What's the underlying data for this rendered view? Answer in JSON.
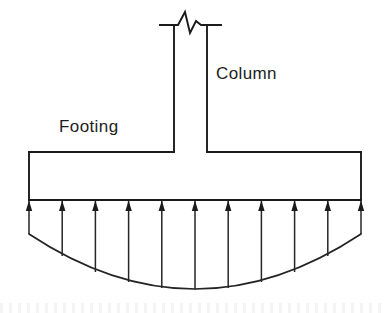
{
  "figure": {
    "type": "engineering-diagram",
    "background_color": "#ffffff",
    "line_color": "#1b1b1b",
    "labels": {
      "column": "Column",
      "footing": "Footing"
    },
    "label_positions": {
      "column": {
        "x": 216,
        "y": 79
      },
      "footing": {
        "x": 59,
        "y": 132
      }
    },
    "column": {
      "left_x": 174,
      "right_x": 207,
      "top_y": 25,
      "bottom_y": 152,
      "break_symbol": "zigzag-break",
      "break_left_tick_x": 160,
      "break_right_tick_x": 221,
      "break_points": "160,25 178,25 185,12 190,33 196,21 201,25 221,25"
    },
    "footing": {
      "left_x": 29,
      "right_x": 361,
      "top_y": 152,
      "bottom_y": 200
    },
    "pressure_distribution": {
      "shape": "sagging-parabolic-curve",
      "description": "Upward soil bearing pressure arrows, larger at center",
      "arrow_count": 11,
      "arrow_direction": "up",
      "baseline_y": 200,
      "left_end": {
        "x": 29,
        "y": 234
      },
      "right_end": {
        "x": 361,
        "y": 234
      },
      "lowest_point": {
        "x": 195,
        "y": 289
      },
      "arrow_x_positions": [
        29,
        62.2,
        95.4,
        128.6,
        161.8,
        195,
        228.2,
        261.4,
        294.6,
        327.8,
        361
      ],
      "arrow_tail_y": [
        234,
        256,
        272,
        282,
        288,
        289.5,
        288,
        282,
        272,
        256,
        234
      ],
      "arrow_head_length": 11,
      "arrow_head_half_width": 3.2
    }
  }
}
